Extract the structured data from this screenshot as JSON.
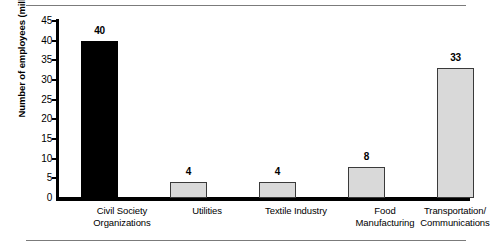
{
  "chart_data": {
    "type": "bar",
    "title": "",
    "xlabel": "",
    "ylabel": "Number of employees (millions)",
    "ylim": [
      0,
      45
    ],
    "ytick_step": 5,
    "grid": false,
    "legend": null,
    "categories": [
      "Civil Society Organizations",
      "Utilities",
      "Textile Industry",
      "Food Manufacturing",
      "Transportation/ Communications"
    ],
    "category_lines": [
      [
        "Civil Society",
        "Organizations"
      ],
      [
        "Utilities",
        ""
      ],
      [
        "Textile Industry",
        ""
      ],
      [
        "Food",
        "Manufacturing"
      ],
      [
        "Transportation/",
        "Communications"
      ]
    ],
    "values": [
      40,
      4,
      4,
      8,
      33
    ],
    "value_labels": [
      "40",
      "4",
      "4",
      "8",
      "33"
    ],
    "bar_colors": [
      "#000000",
      "#d9d9d9",
      "#d9d9d9",
      "#d9d9d9",
      "#d9d9d9"
    ],
    "ytick_labels": [
      "45",
      "40",
      "35",
      "30",
      "25",
      "20",
      "15",
      "10",
      "5",
      "0"
    ],
    "ytick_values": [
      45,
      40,
      35,
      30,
      25,
      20,
      15,
      10,
      5,
      0
    ]
  },
  "figure": {
    "axis_color": "#000000",
    "rule_color": "#7b7b7b",
    "background": "#ffffff"
  }
}
